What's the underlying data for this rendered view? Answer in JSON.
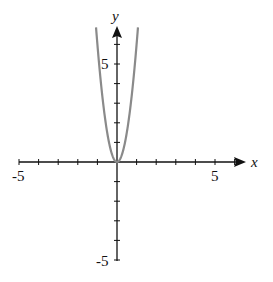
{
  "chart_data": {
    "type": "line",
    "title": "",
    "xlabel": "x",
    "ylabel": "y",
    "xlim": [
      -5,
      6.3
    ],
    "ylim": [
      -5,
      7.2
    ],
    "x_tick_step": 1,
    "y_tick_step": 1,
    "x_tick_labels": [
      "-5",
      "5"
    ],
    "y_tick_labels": [
      "5",
      "-5"
    ],
    "grid": false,
    "series": [
      {
        "name": "y = 6x^2",
        "color": "#8a8a8a",
        "function": "6*x^2",
        "x_range": [
          -1.07,
          1.07
        ]
      }
    ]
  },
  "labels": {
    "x_axis": "x",
    "y_axis": "y",
    "x_neg": "-5",
    "x_pos": "5",
    "y_pos": "5",
    "y_neg": "-5"
  }
}
